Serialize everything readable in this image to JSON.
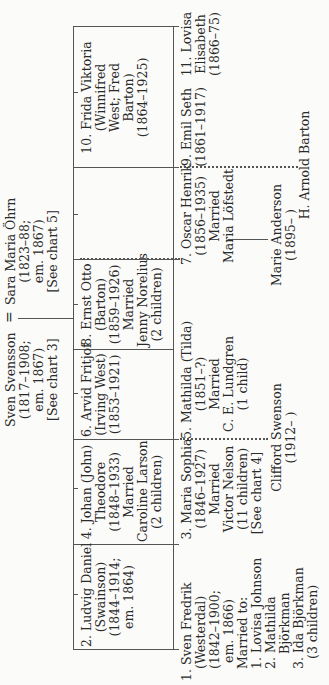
{
  "parents": {
    "father": {
      "name": "Sven Svensson",
      "lines": [
        "(1817–1908;",
        "em. 1867)",
        "[See chart 3]"
      ]
    },
    "marriage_symbol": "=",
    "mother": {
      "name": "Sara Maria Öhrn",
      "lines": [
        "(1823–88;",
        "em. 1867)",
        "[See chart 5]"
      ]
    }
  },
  "children_row_a": [
    {
      "number": "2.",
      "name": "Ludvig Daniel",
      "lines": [
        "(Swainson)",
        "(1844–1914;",
        "em. 1864)"
      ]
    },
    {
      "number": "4.",
      "name": "Johan (John)",
      "lines": [
        "Theodore",
        "(1848–1933)",
        "Married",
        "Caroline Larson",
        "(2 children)"
      ]
    },
    {
      "number": "6.",
      "name": "Arvid Fritjof",
      "lines": [
        "(Irving West)",
        "(1853–1921)"
      ]
    },
    {
      "number": "8.",
      "name": "Ernst Otto",
      "lines": [
        "(Barton)",
        "(1859–1926)",
        "Married",
        "Jenny Norelius",
        "(2 children)"
      ]
    },
    {
      "number": "10.",
      "name": "Frida Viktoria",
      "lines": [
        "(Winnifred",
        "West; Fred",
        "Barton)",
        "(1864–1925)"
      ]
    }
  ],
  "children_row_b": [
    {
      "number": "1.",
      "name": "Sven Fredrik",
      "lines": [
        "(Westerdal)",
        "(1842–1900;",
        "em. 1866)",
        "Married to:",
        "1. Lovisa Johnson",
        "2. Mathilda",
        "Björkman",
        "3. Ida Björkman",
        "(3 children)"
      ]
    },
    {
      "number": "3.",
      "name": "Maria Sophia",
      "lines": [
        "(1846–1927)",
        "Married",
        "Victor Nelson",
        "(11 children)",
        "[See chart 4]"
      ]
    },
    {
      "number": "5.",
      "name": "Mathilda (Tilda)",
      "lines": [
        "(1851–?)",
        "Married",
        "C. E. Lundgren",
        "(1 child)"
      ]
    },
    {
      "number": "7.",
      "name": "Oscar Henrik",
      "lines": [
        "(1856–1935)",
        "Married",
        "Maria Löfstedt"
      ]
    },
    {
      "number": "9.",
      "name": "Emil Seth",
      "lines": [
        "(1861–1917)"
      ]
    },
    {
      "number": "11.",
      "name": "Lovisa",
      "lines": [
        "Elisabeth",
        "(1866–75)"
      ]
    }
  ],
  "grandchildren": [
    {
      "name": "Clifford Swenson",
      "lines": [
        "(1912–      )"
      ]
    },
    {
      "name": "Marie Anderson",
      "lines": [
        "(1895–      )"
      ]
    },
    {
      "name": "H. Arnold Barton",
      "lines": []
    }
  ],
  "colors": {
    "ink": "#2a2a2a",
    "line": "#555555",
    "paper": "#fbfbf9"
  }
}
